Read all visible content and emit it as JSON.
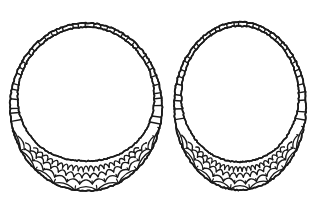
{
  "figure": {
    "medium": "ink line drawing",
    "background_color": "#ffffff",
    "ink_color": "#1a1a1a",
    "object_count": 2,
    "canvas": {
      "width": 310,
      "height": 210
    },
    "objects": [
      {
        "id": "left-ring",
        "name": "left-coiled-ring",
        "center_x": 86,
        "center_y": 107,
        "radius_x": 76,
        "radius_y": 84,
        "band_min_width": 4,
        "band_max_width": 30,
        "stitch_count": 64,
        "scale_rows": 4,
        "bounds": {
          "left": 10,
          "top": 23,
          "right": 162,
          "bottom": 192
        }
      },
      {
        "id": "right-ring",
        "name": "right-coiled-ring",
        "center_x": 240,
        "center_y": 106,
        "radius_x": 66,
        "radius_y": 84,
        "band_min_width": 4,
        "band_max_width": 28,
        "stitch_count": 62,
        "scale_rows": 4,
        "bounds": {
          "left": 175,
          "top": 22,
          "right": 306,
          "bottom": 190
        }
      }
    ]
  },
  "labels": {
    "figure_caption": "",
    "left_label": "",
    "right_label": ""
  }
}
